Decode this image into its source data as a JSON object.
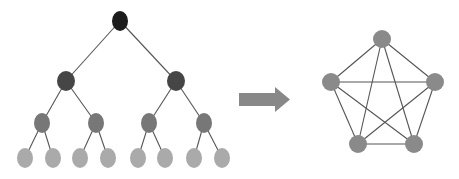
{
  "diagram": {
    "edge_color": "#555555",
    "tree": {
      "levels": [
        {
          "color": "#1c1c1c",
          "rx": 8,
          "ry": 10,
          "nodes": [
            [
              120,
              21
            ]
          ]
        },
        {
          "color": "#464646",
          "rx": 9,
          "ry": 10,
          "nodes": [
            [
              66,
              81
            ],
            [
              176,
              81
            ]
          ]
        },
        {
          "color": "#777777",
          "rx": 8,
          "ry": 10,
          "nodes": [
            [
              42,
              123
            ],
            [
              96,
              123
            ],
            [
              149,
              123
            ],
            [
              204,
              123
            ]
          ]
        },
        {
          "color": "#aaaaaa",
          "rx": 8,
          "ry": 10,
          "nodes": [
            [
              25,
              158
            ],
            [
              53,
              158
            ],
            [
              80,
              158
            ],
            [
              108,
              158
            ],
            [
              138,
              158
            ],
            [
              165,
              158
            ],
            [
              194,
              158
            ],
            [
              222,
              158
            ]
          ]
        }
      ]
    },
    "arrow": {
      "color": "#888888",
      "direction": "right",
      "shaft": {
        "x": 239,
        "y": 93,
        "width": 36,
        "height": 13
      },
      "head": {
        "base_x": 275,
        "tip_x": 290,
        "top_y": 87,
        "bottom_y": 112
      }
    },
    "graph": {
      "type": "complete-graph-K5",
      "node_color": "#8a8a8a",
      "r": 9,
      "nodes": [
        [
          382,
          39
        ],
        [
          331,
          82
        ],
        [
          435,
          82
        ],
        [
          358,
          144
        ],
        [
          414,
          144
        ]
      ]
    }
  }
}
